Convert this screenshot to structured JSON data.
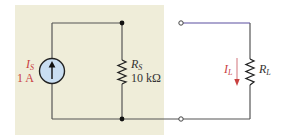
{
  "diagram": {
    "type": "circuit",
    "source": {
      "symbol": "I",
      "subscript": "S",
      "value": "1 A",
      "kind": "current-source",
      "arrow": "up"
    },
    "source_resistor": {
      "symbol": "R",
      "subscript": "S",
      "value": "10 kΩ"
    },
    "load_resistor": {
      "symbol": "R",
      "subscript": "L"
    },
    "load_current": {
      "symbol": "I",
      "subscript": "L",
      "direction": "down"
    },
    "terminals": [
      "top-terminal",
      "bottom-terminal"
    ],
    "colors": {
      "panel": "#efedd9",
      "wire": "#555555",
      "source_fill": "#c9def2",
      "label_red": "#c9403f",
      "wire_top_green": "#4fb8a0",
      "wire_top_blue": "#5a4fa0"
    }
  }
}
